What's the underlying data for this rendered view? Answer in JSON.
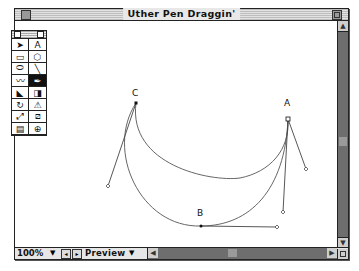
{
  "window": {
    "title": "Uther Pen Draggin'"
  },
  "toolbox": {
    "tools": [
      {
        "name": "arrow-tool",
        "glyph": "➤",
        "active": false
      },
      {
        "name": "text-tool",
        "glyph": "A",
        "active": false
      },
      {
        "name": "rectangle-tool",
        "glyph": "▭",
        "active": false
      },
      {
        "name": "polygon-tool",
        "glyph": "⬡",
        "active": false
      },
      {
        "name": "ellipse-tool",
        "glyph": "⬭",
        "active": false
      },
      {
        "name": "line-tool",
        "glyph": "╲",
        "active": false
      },
      {
        "name": "freehand-tool",
        "glyph": "〰",
        "active": false
      },
      {
        "name": "pen-tool",
        "glyph": "✒",
        "active": true
      },
      {
        "name": "knife-tool",
        "glyph": "◣",
        "active": false
      },
      {
        "name": "corner-tool",
        "glyph": "◨",
        "active": false
      },
      {
        "name": "rotate-tool",
        "glyph": "↻",
        "active": false
      },
      {
        "name": "reflect-tool",
        "glyph": "⚠",
        "active": false
      },
      {
        "name": "scale-tool",
        "glyph": "⤢",
        "active": false
      },
      {
        "name": "skew-tool",
        "glyph": "⧄",
        "active": false
      },
      {
        "name": "trace-tool",
        "glyph": "▤",
        "active": false
      },
      {
        "name": "magnify-tool",
        "glyph": "⊕",
        "active": false
      }
    ]
  },
  "canvas": {
    "points": [
      {
        "label": "A",
        "x": 288,
        "y": 119
      },
      {
        "label": "B",
        "x": 201,
        "y": 226
      },
      {
        "label": "C",
        "x": 136,
        "y": 103
      }
    ]
  },
  "statusbar": {
    "zoom": "100%",
    "view_mode": "Preview"
  }
}
